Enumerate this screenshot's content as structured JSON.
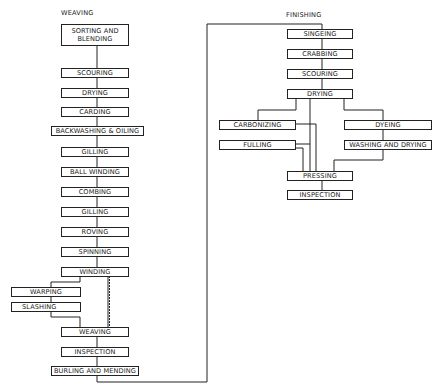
{
  "diagram": {
    "type": "process-flowchart",
    "sections": {
      "weaving": {
        "label": "WEAVING",
        "steps": [
          "SORTING AND BLENDING",
          "SCOURING",
          "DRYING",
          "CARDING",
          "BACKWASHING & OILING",
          "GILLING",
          "BALL WINDING",
          "COMBING",
          "GILLING",
          "ROVING",
          "SPINNING",
          "WINDING",
          "WARPING",
          "SLASHING",
          "WEAVING",
          "INSPECTION",
          "BURLING AND MENDING"
        ]
      },
      "finishing": {
        "label": "FINISHING",
        "steps": [
          "SINGEING",
          "CRABBING",
          "SCOURING",
          "DRYING",
          "CARBONIZING",
          "FULLING",
          "DYEING",
          "WASHING AND DRYING",
          "PRESSING",
          "INSPECTION"
        ]
      }
    },
    "connections": [
      [
        "SORTING AND BLENDING",
        "SCOURING"
      ],
      [
        "SCOURING",
        "DRYING"
      ],
      [
        "DRYING",
        "CARDING"
      ],
      [
        "CARDING",
        "BACKWASHING & OILING"
      ],
      [
        "BACKWASHING & OILING",
        "GILLING"
      ],
      [
        "GILLING",
        "BALL WINDING"
      ],
      [
        "BALL WINDING",
        "COMBING"
      ],
      [
        "COMBING",
        "GILLING"
      ],
      [
        "GILLING",
        "ROVING"
      ],
      [
        "ROVING",
        "SPINNING"
      ],
      [
        "SPINNING",
        "WINDING"
      ],
      [
        "WINDING",
        "WARPING"
      ],
      [
        "WARPING",
        "SLASHING"
      ],
      [
        "SLASHING",
        "WEAVING"
      ],
      [
        "WINDING",
        "WEAVING"
      ],
      [
        "WEAVING",
        "INSPECTION"
      ],
      [
        "INSPECTION",
        "BURLING AND MENDING"
      ],
      [
        "BURLING AND MENDING",
        "SINGEING"
      ],
      [
        "SINGEING",
        "CRABBING"
      ],
      [
        "CRABBING",
        "SCOURING"
      ],
      [
        "SCOURING",
        "DRYING"
      ],
      [
        "DRYING",
        "CARBONIZING"
      ],
      [
        "DRYING",
        "FULLING"
      ],
      [
        "DRYING",
        "DYEING"
      ],
      [
        "CARBONIZING",
        "FULLING"
      ],
      [
        "CARBONIZING",
        "PRESSING"
      ],
      [
        "FULLING",
        "PRESSING"
      ],
      [
        "DYEING",
        "WASHING AND DRYING"
      ],
      [
        "WASHING AND DRYING",
        "PRESSING"
      ],
      [
        "PRESSING",
        "INSPECTION"
      ]
    ]
  }
}
